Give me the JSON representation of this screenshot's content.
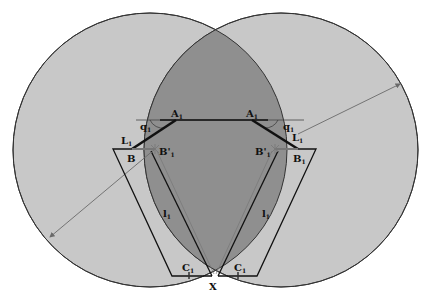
{
  "figure": {
    "type": "parallel-mechanism workspace diagram",
    "colors": {
      "background": "#ffffff",
      "circle_fill": "#c8c8c8",
      "intersection_fill": "#8f8f8f",
      "outline": "#333333",
      "link": "#111111",
      "guide": "#6a6a6a"
    },
    "circles": [
      {
        "name": "left-workspace-circle",
        "cx": 150,
        "cy": 150,
        "r": 137
      },
      {
        "name": "right-workspace-circle",
        "cx": 281,
        "cy": 150,
        "r": 137
      }
    ],
    "labels": {
      "A_left": {
        "main": "A",
        "sub": "1"
      },
      "A_right": {
        "main": "A",
        "sub": "1"
      },
      "q_left": {
        "main": "q",
        "sub": "1"
      },
      "q_right": {
        "main": "q",
        "sub": "1"
      },
      "L_left": {
        "main": "L",
        "sub": "1"
      },
      "L_right": {
        "main": "L",
        "sub": "1"
      },
      "B_left": {
        "main": "B",
        "sub": ""
      },
      "B_right": {
        "main": "B",
        "sub": "1"
      },
      "Bp_left": {
        "main": "B'",
        "sub": "1"
      },
      "Bp_right": {
        "main": "B'",
        "sub": "1"
      },
      "l_left": {
        "main": "l",
        "sub": "1"
      },
      "l_right": {
        "main": "l",
        "sub": "1"
      },
      "C_left": {
        "main": "C",
        "sub": "1"
      },
      "C_right": {
        "main": "C",
        "sub": "1"
      },
      "X": {
        "main": "X"
      }
    }
  }
}
